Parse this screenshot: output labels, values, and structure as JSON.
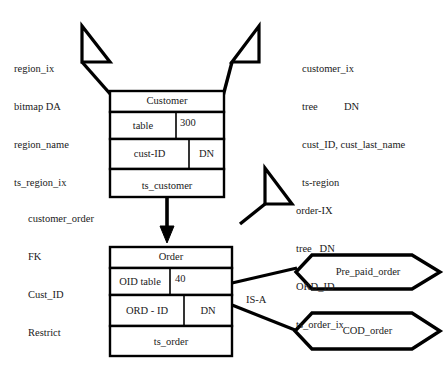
{
  "diagram": {
    "type": "entity-relationship-physical-design",
    "annotations": {
      "region_index": {
        "lines": [
          "region_ix",
          "bitmap DA",
          "region_name",
          "ts_region_ix"
        ]
      },
      "customer_index": {
        "lines": [
          "customer_ix",
          "tree          DN",
          "cust_ID, cust_last_name",
          "ts-region"
        ]
      },
      "customer_order_fk": {
        "lines": [
          "customer_order",
          "FK",
          "Cust_ID",
          "Restrict"
        ]
      },
      "order_index": {
        "lines": [
          "order-IX",
          "tree   DN",
          "ORD_ID",
          "ts_order_ix"
        ]
      }
    },
    "entities": [
      {
        "name": "customer-entity",
        "title": "Customer",
        "rows": [
          {
            "left": "table",
            "right": "300"
          },
          {
            "left": "cust-ID",
            "right": "DN"
          }
        ],
        "footer": "ts_customer"
      },
      {
        "name": "order-entity",
        "title": "Order",
        "rows": [
          {
            "left": "OID table",
            "right": "40"
          },
          {
            "left": "ORD - ID",
            "right": "DN"
          }
        ],
        "footer": "ts_order"
      }
    ],
    "subtypes": [
      {
        "name": "pre-paid-order",
        "label": "Pre_paid_order"
      },
      {
        "name": "cod-order",
        "label": "COD_order"
      }
    ],
    "relationship_labels": {
      "is_a": "IS-A"
    },
    "colors": {
      "stroke": "#000000",
      "text": "#1a1a1a",
      "background": "#ffffff"
    }
  }
}
